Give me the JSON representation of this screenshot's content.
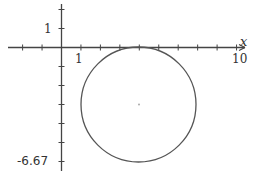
{
  "chart_data": {
    "type": "line",
    "title": "",
    "xlabel": "x",
    "ylabel": "",
    "xlim": [
      -2.5,
      10.4
    ],
    "ylim": [
      -6.67,
      2.4
    ],
    "x_tick_step": 1,
    "y_tick_step": 1,
    "grid": false,
    "labels": {
      "x_tick_1": "1",
      "x_tick_10": "10",
      "y_tick_1": "1",
      "y_min": "-6.67",
      "x_axis": "x"
    },
    "series": [
      {
        "name": "circle",
        "shape": "circle",
        "center": [
          4,
          -3
        ],
        "radius": 3,
        "color": "#555555"
      }
    ],
    "annotations": [
      {
        "type": "point",
        "x": 4,
        "y": -3,
        "label": "center"
      }
    ]
  },
  "colors": {
    "axis": "#444444",
    "curve": "#555555",
    "center_dot": "#aaaaaa"
  }
}
